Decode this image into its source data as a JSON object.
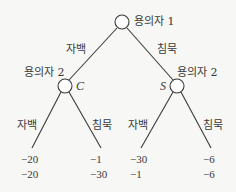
{
  "diagram": {
    "type": "game-tree",
    "root": {
      "player_label": "용의자 1"
    },
    "branches_level1": {
      "left": "자백",
      "right": "침묵"
    },
    "left_node": {
      "player_label": "용의자 2",
      "node_mark": "C"
    },
    "right_node": {
      "player_label": "용의자 2",
      "node_mark": "S"
    },
    "branches_level2": {
      "left_left": "자백",
      "left_right": "침묵",
      "right_left": "자백",
      "right_right": "침묵"
    },
    "payoffs": [
      {
        "p1": "−20",
        "p2": "−20"
      },
      {
        "p1": "−1",
        "p2": "−30"
      },
      {
        "p1": "−30",
        "p2": "−1"
      },
      {
        "p1": "−6",
        "p2": "−6"
      }
    ],
    "colors": {
      "background": "#f7f7f5",
      "line": "#3a3a3a"
    }
  }
}
